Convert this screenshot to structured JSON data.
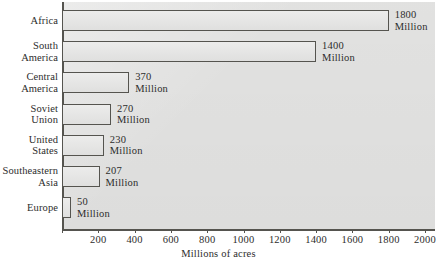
{
  "chart": {
    "type": "bar",
    "title": "",
    "xlabel": "Millions of acres",
    "ylabel": "",
    "unit_word": "Million"
  },
  "chart_data": {
    "type": "bar",
    "orientation": "horizontal",
    "title": "",
    "xlabel": "Millions of acres",
    "ylabel": "",
    "xlim": [
      0,
      2000
    ],
    "xticks": [
      0,
      200,
      400,
      600,
      800,
      1000,
      1200,
      1400,
      1600,
      1800,
      2000
    ],
    "xticklabels": [
      "",
      "200",
      "400",
      "600",
      "800",
      "1000",
      "1200",
      "1400",
      "1600",
      "1800",
      "2000"
    ],
    "grid": false,
    "legend": null,
    "categories": [
      "Africa",
      "South America",
      "Central America",
      "Soviet Union",
      "United States",
      "Southeastern Asia",
      "Europe"
    ],
    "values": [
      1800,
      1400,
      370,
      270,
      230,
      207,
      50
    ],
    "value_labels": [
      "1800",
      "1400",
      "370",
      "270",
      "230",
      "207",
      "50"
    ],
    "value_unit": "Million"
  },
  "rows": [
    {
      "label_line1": "Africa",
      "label_line2": "",
      "value": "1800",
      "unit": "Million"
    },
    {
      "label_line1": "South",
      "label_line2": "America",
      "value": "1400",
      "unit": "Million"
    },
    {
      "label_line1": "Central",
      "label_line2": "America",
      "value": "370",
      "unit": "Million"
    },
    {
      "label_line1": "Soviet",
      "label_line2": "Union",
      "value": "270",
      "unit": "Million"
    },
    {
      "label_line1": "United",
      "label_line2": "States",
      "value": "230",
      "unit": "Million"
    },
    {
      "label_line1": "Southeastern",
      "label_line2": "Asia",
      "value": "207",
      "unit": "Million"
    },
    {
      "label_line1": "Europe",
      "label_line2": "",
      "value": "50",
      "unit": "Million"
    }
  ],
  "axis": {
    "ticks": [
      {
        "value": 0,
        "label": ""
      },
      {
        "value": 200,
        "label": "200"
      },
      {
        "value": 400,
        "label": "400"
      },
      {
        "value": 600,
        "label": "600"
      },
      {
        "value": 800,
        "label": "800"
      },
      {
        "value": 1000,
        "label": "1000"
      },
      {
        "value": 1200,
        "label": "1200"
      },
      {
        "value": 1400,
        "label": "1400"
      },
      {
        "value": 1600,
        "label": "1600"
      },
      {
        "value": 1800,
        "label": "1800"
      },
      {
        "value": 2000,
        "label": "2000"
      }
    ],
    "title": "Millions of acres"
  },
  "colors": {
    "ink": "#2d2d2c",
    "rule": "#55544f",
    "panel": "#e4e4e3",
    "page": "#ffffff"
  }
}
